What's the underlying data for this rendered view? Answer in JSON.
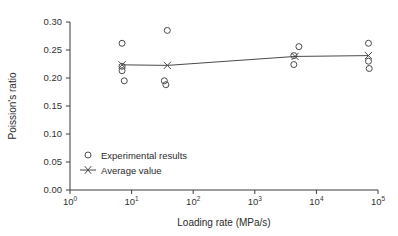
{
  "chart_data": {
    "type": "scatter",
    "title": "",
    "xlabel": "Loading rate (MPa/s)",
    "ylabel": "Poission's ratio",
    "xscale": "log",
    "xlim": [
      1,
      100000
    ],
    "ylim": [
      0.0,
      0.3
    ],
    "grid": false,
    "legend_position": "inner-lower-left",
    "x_ticks": [
      {
        "value": 1,
        "label": "10",
        "exponent": "0"
      },
      {
        "value": 10,
        "label": "10",
        "exponent": "1"
      },
      {
        "value": 100,
        "label": "10",
        "exponent": "2"
      },
      {
        "value": 1000,
        "label": "10",
        "exponent": "3"
      },
      {
        "value": 10000,
        "label": "10",
        "exponent": "4"
      },
      {
        "value": 100000,
        "label": "10",
        "exponent": "5"
      }
    ],
    "y_ticks": [
      {
        "value": 0.0,
        "label": "0.00"
      },
      {
        "value": 0.05,
        "label": "0.05"
      },
      {
        "value": 0.1,
        "label": "0.10"
      },
      {
        "value": 0.15,
        "label": "0.15"
      },
      {
        "value": 0.2,
        "label": "0.20"
      },
      {
        "value": 0.25,
        "label": "0.25"
      },
      {
        "value": 0.3,
        "label": "0.30"
      }
    ],
    "series": [
      {
        "name": "Experimental results",
        "marker": "circle",
        "points": [
          {
            "x": 7,
            "y": 0.262
          },
          {
            "x": 7,
            "y": 0.213
          },
          {
            "x": 7.6,
            "y": 0.195
          },
          {
            "x": 7,
            "y": 0.221
          },
          {
            "x": 38,
            "y": 0.285
          },
          {
            "x": 34,
            "y": 0.195
          },
          {
            "x": 36,
            "y": 0.188
          },
          {
            "x": 5200,
            "y": 0.256
          },
          {
            "x": 4300,
            "y": 0.224
          },
          {
            "x": 4300,
            "y": 0.24
          },
          {
            "x": 70000,
            "y": 0.262
          },
          {
            "x": 70000,
            "y": 0.23
          },
          {
            "x": 72000,
            "y": 0.217
          }
        ]
      },
      {
        "name": "Average value",
        "marker": "x",
        "line": true,
        "points": [
          {
            "x": 7,
            "y": 0.2235
          },
          {
            "x": 38,
            "y": 0.2225
          },
          {
            "x": 4500,
            "y": 0.2385
          },
          {
            "x": 70000,
            "y": 0.24
          }
        ]
      }
    ],
    "legend": [
      {
        "label": "Experimental results",
        "marker": "circle"
      },
      {
        "label": "Average value",
        "marker": "x-line"
      }
    ],
    "colors": {
      "axis": "#3a3a3a",
      "marker": "#4a4a4a",
      "trend_line": "#4a4a4a",
      "text": "#2b2b2b",
      "background": "#ffffff"
    }
  }
}
